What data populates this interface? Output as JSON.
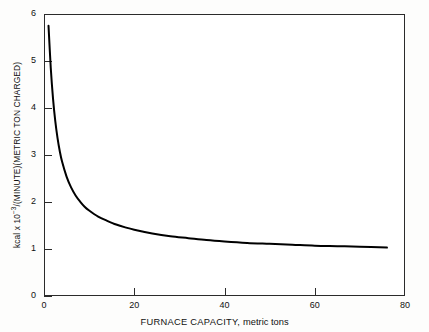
{
  "chart_data": {
    "type": "line",
    "title": "",
    "xlabel": "FURNACE CAPACITY, metric tons",
    "xlabel_main": "FURNACE CAPACITY,",
    "xlabel_unit": "metric tons",
    "ylabel": "kcal x 10-3/(MINUTE)(METRIC TON CHARGED)",
    "ylabel_prefix": "kcal x 10",
    "ylabel_exponent": "−3",
    "ylabel_suffix": "/(MINUTE)(METRIC TON CHARGED)",
    "xlim": [
      0,
      80
    ],
    "ylim": [
      0,
      6
    ],
    "xticks": [
      0,
      20,
      40,
      60,
      80
    ],
    "xtick_labels": [
      "0",
      "20",
      "40",
      "60",
      "80"
    ],
    "yticks": [
      0,
      1,
      2,
      3,
      4,
      5,
      6
    ],
    "ytick_labels": [
      "0",
      "1",
      "2",
      "3",
      "4",
      "5",
      "6"
    ],
    "grid": false,
    "legend": null,
    "line_color": "#000000",
    "line_width": 2.0,
    "frame_color": "#2b2b2b",
    "background_color": "#ffffff",
    "series": [
      {
        "name": "heat requirement",
        "x": [
          1.0,
          1.5,
          2.0,
          2.5,
          3.0,
          3.5,
          4.0,
          5.0,
          6.0,
          7.0,
          8.0,
          9.0,
          10.0,
          12.0,
          14.0,
          16.0,
          18.0,
          20.0,
          24.0,
          28.0,
          32.0,
          36.0,
          40.0,
          45.0,
          50.0,
          55.0,
          60.0,
          65.0,
          70.0,
          76.0
        ],
        "y": [
          5.75,
          4.85,
          4.2,
          3.72,
          3.36,
          3.08,
          2.86,
          2.54,
          2.31,
          2.14,
          2.01,
          1.9,
          1.82,
          1.69,
          1.6,
          1.52,
          1.46,
          1.41,
          1.33,
          1.27,
          1.23,
          1.19,
          1.16,
          1.13,
          1.11,
          1.09,
          1.07,
          1.06,
          1.05,
          1.03
        ]
      }
    ],
    "annotations": []
  }
}
